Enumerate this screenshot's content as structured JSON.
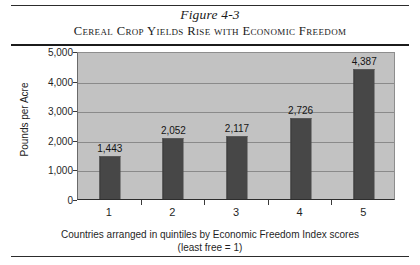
{
  "figure": {
    "number": "Figure 4-3",
    "caption": "Cereal Crop Yields Rise with Economic Freedom"
  },
  "chart_data": {
    "type": "bar",
    "title": "Cereal Crop Yields Rise with Economic Freedom",
    "subtitle": "Figure 4-3",
    "categories": [
      "1",
      "2",
      "3",
      "4",
      "5"
    ],
    "values": [
      1443,
      2052,
      2117,
      2726,
      4387
    ],
    "value_labels": [
      "1,443",
      "2,052",
      "2,117",
      "2,726",
      "4,387"
    ],
    "xlabel": "Countries arranged in quintiles by Economic Freedom Index scores",
    "xlabel_line2": "(least free = 1)",
    "ylabel": "Pounds per Acre",
    "ylim": [
      0,
      5000
    ],
    "ytick_values": [
      0,
      1000,
      2000,
      3000,
      4000,
      5000
    ],
    "ytick_labels": [
      "0",
      "1,000",
      "2,000",
      "3,000",
      "4,000",
      "5,000"
    ],
    "grid": true,
    "legend": false,
    "colors": {
      "bar": "#474747",
      "plot_background": "#c2c2c2",
      "gridline": "#8a8a8a",
      "text": "#1f1f1f",
      "rule": "#1b1b1b"
    }
  }
}
